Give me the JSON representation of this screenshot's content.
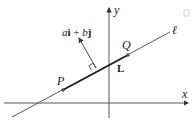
{
  "diagram": {
    "axes": {
      "x_label": "x",
      "y_label": "y"
    },
    "line": {
      "label": "ℓ"
    },
    "points": [
      {
        "name": "P",
        "label": "P"
      },
      {
        "name": "Q",
        "label": "Q"
      }
    ],
    "segment_label": "L",
    "normal_vector": {
      "a": "a",
      "i": "i",
      "plus": " + ",
      "b": "b",
      "j": "j"
    },
    "colors": {
      "stroke": "#333333",
      "point": "#555555"
    }
  }
}
